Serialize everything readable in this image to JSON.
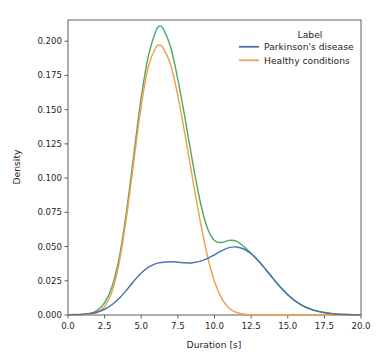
{
  "figure": {
    "background_color": "#ffffff",
    "axes_color": "#4d4d4d",
    "text_color": "#262626"
  },
  "legend": {
    "title": "Label",
    "position": "upper right",
    "entries": [
      {
        "label": "Parkinson's disease",
        "color": "#4c72b0"
      },
      {
        "label": "Healthy conditions",
        "color": "#f0a04b"
      }
    ]
  },
  "axis": {
    "x": {
      "title": "Duration [s]",
      "ticks": [
        "0.0",
        "2.5",
        "5.0",
        "7.5",
        "10.0",
        "12.5",
        "15.0",
        "17.5",
        "20.0"
      ]
    },
    "y": {
      "title": "Density",
      "ticks": [
        "0.000",
        "0.025",
        "0.050",
        "0.075",
        "0.100",
        "0.125",
        "0.150",
        "0.175",
        "0.200"
      ]
    }
  },
  "chart_data": {
    "type": "line",
    "title": "",
    "xlabel": "Duration [s]",
    "ylabel": "Density",
    "xlim": [
      0.0,
      20.0
    ],
    "ylim": [
      0.0,
      0.2155
    ],
    "xticks": [
      0.0,
      2.5,
      5.0,
      7.5,
      10.0,
      12.5,
      15.0,
      17.5,
      20.0
    ],
    "yticks": [
      0.0,
      0.025,
      0.05,
      0.075,
      0.1,
      0.125,
      0.15,
      0.175,
      0.2
    ],
    "grid": false,
    "legend_position": "upper right",
    "legend_title": "Label",
    "x": [
      0.0,
      0.5,
      1.0,
      1.5,
      2.0,
      2.5,
      3.0,
      3.5,
      4.0,
      4.5,
      5.0,
      5.5,
      6.0,
      6.25,
      6.5,
      7.0,
      7.5,
      8.0,
      8.5,
      9.0,
      9.5,
      10.0,
      10.5,
      11.0,
      11.5,
      12.0,
      12.5,
      13.0,
      13.5,
      14.0,
      14.5,
      15.0,
      15.5,
      16.0,
      16.5,
      17.0,
      17.5,
      18.0,
      18.5,
      19.0,
      19.5,
      20.0
    ],
    "series": [
      {
        "name": "Parkinson's disease",
        "color": "#4c72b0",
        "values": [
          0.0002,
          0.0003,
          0.0006,
          0.0011,
          0.0022,
          0.0042,
          0.0075,
          0.0122,
          0.0182,
          0.0248,
          0.0307,
          0.035,
          0.0375,
          0.0382,
          0.0386,
          0.0389,
          0.0386,
          0.0381,
          0.0382,
          0.0392,
          0.0412,
          0.044,
          0.047,
          0.0492,
          0.0497,
          0.0482,
          0.0447,
          0.0395,
          0.0332,
          0.0266,
          0.0203,
          0.0148,
          0.0103,
          0.0069,
          0.0045,
          0.0028,
          0.0017,
          0.001,
          0.0006,
          0.0003,
          0.0002,
          0.0001
        ]
      },
      {
        "name": "Healthy conditions",
        "color": "#f0a04b",
        "values": [
          0.0,
          0.0,
          0.0001,
          0.0004,
          0.0018,
          0.0062,
          0.017,
          0.0385,
          0.072,
          0.113,
          0.153,
          0.182,
          0.1955,
          0.197,
          0.195,
          0.183,
          0.16,
          0.131,
          0.1,
          0.07,
          0.044,
          0.0245,
          0.012,
          0.005,
          0.0018,
          0.0006,
          0.0002,
          0.0001,
          0.0,
          0.0,
          0.0,
          0.0,
          0.0,
          0.0,
          0.0,
          0.0,
          0.0,
          0.0,
          0.0,
          0.0,
          0.0,
          0.0
        ]
      },
      {
        "name": "Combined",
        "color": "#55a868",
        "values": [
          0.0001,
          0.0002,
          0.0004,
          0.001,
          0.0034,
          0.009,
          0.0205,
          0.042,
          0.076,
          0.118,
          0.159,
          0.19,
          0.2075,
          0.211,
          0.209,
          0.196,
          0.172,
          0.143,
          0.112,
          0.084,
          0.064,
          0.0545,
          0.053,
          0.0545,
          0.054,
          0.05,
          0.045,
          0.0396,
          0.0333,
          0.0267,
          0.0204,
          0.0149,
          0.0104,
          0.007,
          0.0046,
          0.0029,
          0.0018,
          0.0011,
          0.0006,
          0.0004,
          0.0002,
          0.0001
        ]
      }
    ]
  }
}
